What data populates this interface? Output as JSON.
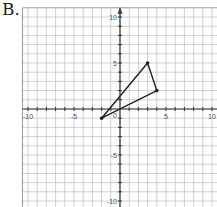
{
  "problem_label": "B.",
  "chart_data": {
    "type": "scatter",
    "title": "",
    "xlabel": "",
    "ylabel": "",
    "xlim": [
      -10.6,
      10.5
    ],
    "ylim": [
      -10.6,
      11
    ],
    "grid": true,
    "x_tick_labels": [
      "-10",
      "-5",
      "5",
      "10"
    ],
    "y_tick_labels": [
      "10",
      "5",
      "-5",
      "-10"
    ],
    "origin_label": "0",
    "shape": "triangle",
    "vertices": [
      {
        "x": -2,
        "y": -1
      },
      {
        "x": 3,
        "y": 5
      },
      {
        "x": 4,
        "y": 2
      }
    ],
    "colors": {
      "grid": "#bdbdbd",
      "axis": "#333333",
      "shape": "#222222"
    }
  }
}
